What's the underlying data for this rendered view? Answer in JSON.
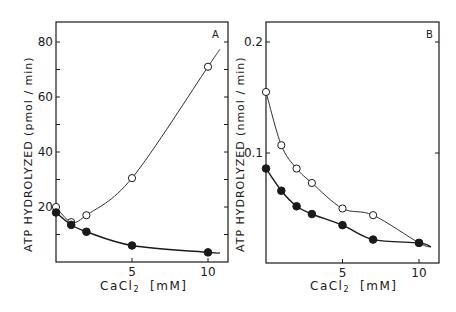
{
  "chart_data": [
    {
      "type": "line",
      "panel": "A",
      "title": "",
      "panel_label": "A",
      "xlabel": "CaCl₂ [mM]",
      "ylabel": "ATP HYDROLYZED (pmol / min)",
      "xlim": [
        0,
        11
      ],
      "ylim": [
        0,
        88
      ],
      "x_ticks": [
        5,
        10
      ],
      "x_tick_labels": [
        "5",
        "10"
      ],
      "y_ticks": [
        10,
        20,
        30,
        40,
        50,
        60,
        70,
        80
      ],
      "y_tick_labels": [
        "20",
        "40",
        "60",
        "80"
      ],
      "grid": false,
      "legend": null,
      "series": [
        {
          "name": "open circles",
          "marker": "open-circle",
          "x": [
            0,
            1,
            2,
            5,
            10
          ],
          "y": [
            20,
            14.5,
            17,
            30.5,
            71
          ]
        },
        {
          "name": "filled circles",
          "marker": "filled-circle",
          "x": [
            0,
            1,
            2,
            5,
            10
          ],
          "y": [
            18,
            13.5,
            11,
            6,
            3.5
          ]
        }
      ]
    },
    {
      "type": "line",
      "panel": "B",
      "title": "",
      "panel_label": "B",
      "xlabel": "CaCl₂ [mM]",
      "ylabel": "ATP HYDROLYZED (nmol / min)",
      "xlim": [
        0,
        11
      ],
      "ylim": [
        0,
        0.22
      ],
      "x_ticks": [
        5,
        10
      ],
      "x_tick_labels": [
        "5",
        "10"
      ],
      "y_ticks": [
        0.1,
        0.2
      ],
      "y_tick_labels": [
        "0.1",
        "0.2"
      ],
      "grid": false,
      "legend": null,
      "series": [
        {
          "name": "open circles",
          "marker": "open-circle",
          "x": [
            0,
            1,
            2,
            3,
            5,
            7,
            10
          ],
          "y": [
            0.155,
            0.107,
            0.086,
            0.073,
            0.05,
            0.044,
            0.019
          ]
        },
        {
          "name": "filled circles",
          "marker": "filled-circle",
          "x": [
            0,
            1,
            2,
            3,
            5,
            7,
            10
          ],
          "y": [
            0.086,
            0.066,
            0.052,
            0.045,
            0.035,
            0.022,
            0.019
          ]
        }
      ]
    }
  ],
  "panels": {
    "A": {
      "label": "A",
      "ylabel": "ATP HYDROLYZED (pmol / min)",
      "xlabel_main": "CaCl",
      "xlabel_sub": "2",
      "xlabel_unit": "[mM]",
      "yticks": [
        "20",
        "40",
        "60",
        "80"
      ],
      "xticks": [
        "5",
        "10"
      ]
    },
    "B": {
      "label": "B",
      "ylabel": "ATP HYDROLYZED (nmol / min)",
      "xlabel_main": "CaCl",
      "xlabel_sub": "2",
      "xlabel_unit": "[mM]",
      "yticks": [
        "0.1",
        "0.2"
      ],
      "xticks": [
        "5",
        "10"
      ]
    }
  },
  "style": {
    "ink": "#1a1a1a",
    "background": "#ffffff"
  }
}
